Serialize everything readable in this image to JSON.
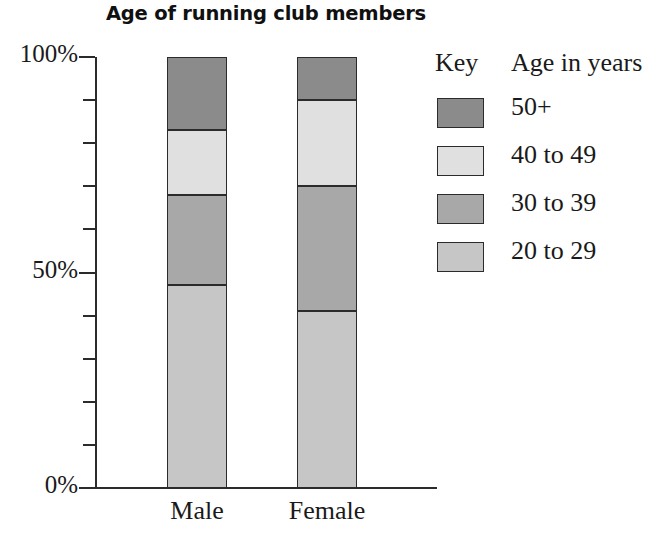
{
  "chart_data": {
    "type": "bar",
    "subtype": "stacked-percentage",
    "title": "Age of running club members",
    "xlabel": "",
    "ylabel": "",
    "ylim": [
      0,
      100
    ],
    "ytick_labels": [
      "100%",
      "50%",
      "0%"
    ],
    "ytick_values": [
      100,
      50,
      0
    ],
    "minor_tick_step": 10,
    "grid": false,
    "categories": [
      "Male",
      "Female"
    ],
    "legend_position": "right",
    "legend_title_key": "Key",
    "legend_title_value": "Age in years",
    "series": [
      {
        "name": "50+",
        "values": [
          17,
          10
        ],
        "color": "#8b8b8b"
      },
      {
        "name": "40 to 49",
        "values": [
          15,
          20
        ],
        "color": "#e0e0e0"
      },
      {
        "name": "30 to 39",
        "values": [
          21,
          29
        ],
        "color": "#a8a8a8"
      },
      {
        "name": "20 to 29",
        "values": [
          47,
          41
        ],
        "color": "#c6c6c6"
      }
    ],
    "stack_boundaries": {
      "Male": [
        47,
        68,
        83,
        100
      ],
      "Female": [
        41,
        70,
        90,
        100
      ]
    }
  },
  "axis": {
    "y_labels": [
      {
        "text": "100%",
        "value": 100
      },
      {
        "text": "50%",
        "value": 50
      },
      {
        "text": "0%",
        "value": 0
      }
    ],
    "minor_ticks": [
      90,
      80,
      70,
      60,
      40,
      30,
      20,
      10
    ]
  },
  "legend": {
    "key_header": "Key",
    "value_header": "Age in years",
    "items": [
      {
        "label": "50+",
        "color": "#8b8b8b"
      },
      {
        "label": "40 to 49",
        "color": "#e0e0e0"
      },
      {
        "label": "30 to 39",
        "color": "#a8a8a8"
      },
      {
        "label": "20 to 29",
        "color": "#c6c6c6"
      }
    ]
  },
  "colors": {
    "axis": "#2b2b2b",
    "background": "#ffffff",
    "text": "#1a1a1a"
  }
}
